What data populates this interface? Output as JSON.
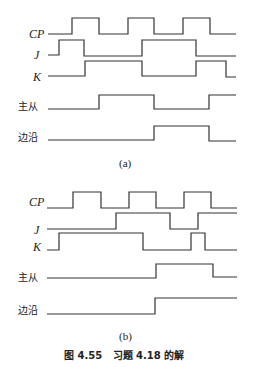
{
  "figure": {
    "caption": "图 4.55   习题 4.18 的解",
    "panels": [
      {
        "sublabel": "(a)",
        "signals": [
          {
            "name": "CP",
            "label": "CP"
          },
          {
            "name": "J",
            "label": "J"
          },
          {
            "name": "K",
            "label": "K"
          },
          {
            "name": "master-slave",
            "label": "主从"
          },
          {
            "name": "edge",
            "label": "边沿"
          }
        ]
      },
      {
        "sublabel": "(b)",
        "signals": [
          {
            "name": "CP",
            "label": "CP"
          },
          {
            "name": "J",
            "label": "J"
          },
          {
            "name": "K",
            "label": "K"
          },
          {
            "name": "master-slave",
            "label": "主从"
          },
          {
            "name": "edge",
            "label": "边沿"
          }
        ]
      }
    ]
  },
  "colors": {
    "line": "#333333",
    "text": "#222222",
    "background": "#ffffff"
  }
}
